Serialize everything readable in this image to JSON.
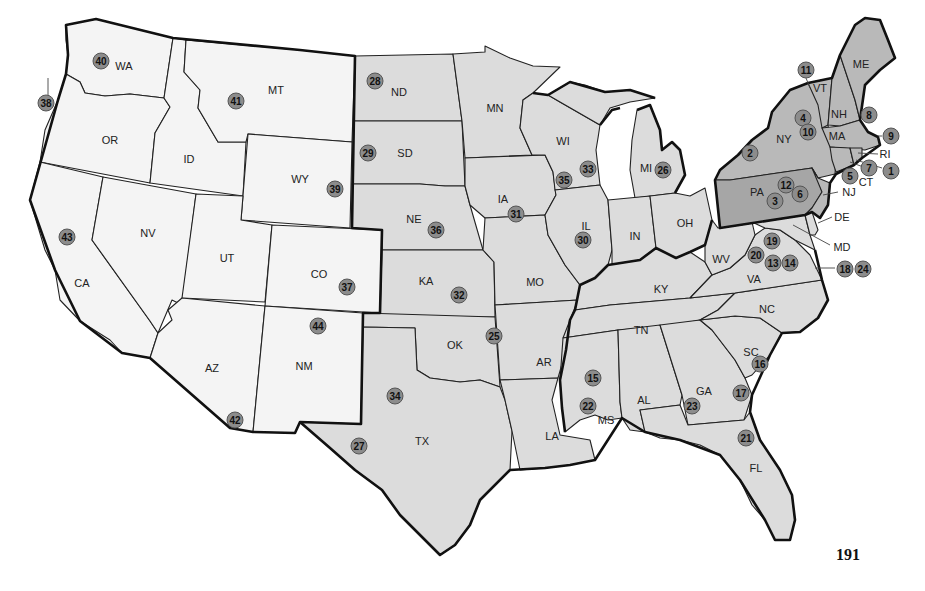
{
  "page_number": "191",
  "colors": {
    "west": "#f4f4f4",
    "central": "#dcdcdc",
    "northeast": "#b9b9b9",
    "pennsylvania": "#a6a6a6",
    "marker": "#8c8c8c",
    "border": "#222222"
  },
  "regions": {
    "west": [
      "WA",
      "OR",
      "CA",
      "ID",
      "NV",
      "MT",
      "WY",
      "UT",
      "CO",
      "AZ",
      "NM"
    ],
    "central_south": [
      "ND",
      "SD",
      "NE",
      "KA",
      "OK",
      "TX",
      "MN",
      "IA",
      "MO",
      "AR",
      "LA",
      "WI",
      "IL",
      "MI",
      "IN",
      "OH",
      "KY",
      "TN",
      "MS",
      "AL",
      "GA",
      "FL",
      "SC",
      "NC",
      "VA",
      "WV",
      "MD",
      "DE"
    ],
    "northeast": [
      "NY",
      "PA",
      "NJ",
      "CT",
      "RI",
      "MA",
      "VT",
      "NH",
      "ME"
    ]
  },
  "states": [
    {
      "abbr": "WA",
      "x": 374,
      "y": 66
    },
    {
      "abbr": "OR",
      "x": 110,
      "y": 140
    },
    {
      "abbr": "CA",
      "x": 82,
      "y": 283
    },
    {
      "abbr": "ID",
      "x": 189,
      "y": 159
    },
    {
      "abbr": "NV",
      "x": 148,
      "y": 233
    },
    {
      "abbr": "MT",
      "x": 276,
      "y": 90
    },
    {
      "abbr": "WY",
      "x": 300,
      "y": 179
    },
    {
      "abbr": "UT",
      "x": 227,
      "y": 258
    },
    {
      "abbr": "CO",
      "x": 319,
      "y": 274
    },
    {
      "abbr": "AZ",
      "x": 212,
      "y": 368
    },
    {
      "abbr": "NM",
      "x": 304,
      "y": 366
    },
    {
      "abbr": "ND",
      "x": 399,
      "y": 92
    },
    {
      "abbr": "SD",
      "x": 405,
      "y": 153
    },
    {
      "abbr": "NE",
      "x": 414,
      "y": 219
    },
    {
      "abbr": "KA",
      "x": 426,
      "y": 281
    },
    {
      "abbr": "OK",
      "x": 455,
      "y": 345
    },
    {
      "abbr": "TX",
      "x": 422,
      "y": 441
    },
    {
      "abbr": "MN",
      "x": 495,
      "y": 108
    },
    {
      "abbr": "IA",
      "x": 503,
      "y": 199
    },
    {
      "abbr": "MO",
      "x": 535,
      "y": 282
    },
    {
      "abbr": "AR",
      "x": 544,
      "y": 362
    },
    {
      "abbr": "LA",
      "x": 552,
      "y": 436
    },
    {
      "abbr": "WI",
      "x": 563,
      "y": 141
    },
    {
      "abbr": "IL",
      "x": 586,
      "y": 226
    },
    {
      "abbr": "MI",
      "x": 646,
      "y": 168
    },
    {
      "abbr": "IN",
      "x": 635,
      "y": 236
    },
    {
      "abbr": "OH",
      "x": 685,
      "y": 223
    },
    {
      "abbr": "KY",
      "x": 661,
      "y": 289
    },
    {
      "abbr": "TN",
      "x": 641,
      "y": 330
    },
    {
      "abbr": "MS",
      "x": 606,
      "y": 420
    },
    {
      "abbr": "AL",
      "x": 644,
      "y": 400
    },
    {
      "abbr": "GA",
      "x": 704,
      "y": 391
    },
    {
      "abbr": "FL",
      "x": 756,
      "y": 468
    },
    {
      "abbr": "SC",
      "x": 751,
      "y": 352
    },
    {
      "abbr": "NC",
      "x": 767,
      "y": 309
    },
    {
      "abbr": "VA",
      "x": 754,
      "y": 279
    },
    {
      "abbr": "WV",
      "x": 721,
      "y": 259
    },
    {
      "abbr": "NY",
      "x": 784,
      "y": 139
    },
    {
      "abbr": "PA",
      "x": 757,
      "y": 192
    },
    {
      "abbr": "VT",
      "x": 820,
      "y": 88
    },
    {
      "abbr": "NH",
      "x": 839,
      "y": 114
    },
    {
      "abbr": "ME",
      "x": 861,
      "y": 64
    },
    {
      "abbr": "MA",
      "x": 837,
      "y": 136
    }
  ],
  "callout_labels": [
    {
      "abbr": "RI",
      "x": 885,
      "y": 154
    },
    {
      "abbr": "CT",
      "x": 866,
      "y": 182
    },
    {
      "abbr": "NJ",
      "x": 849,
      "y": 192
    },
    {
      "abbr": "DE",
      "x": 842,
      "y": 217
    },
    {
      "abbr": "MD",
      "x": 842,
      "y": 247
    }
  ],
  "markers": [
    {
      "num": "1",
      "x": 891,
      "y": 171
    },
    {
      "num": "2",
      "x": 750,
      "y": 153
    },
    {
      "num": "3",
      "x": 775,
      "y": 201
    },
    {
      "num": "4",
      "x": 803,
      "y": 118
    },
    {
      "num": "5",
      "x": 850,
      "y": 176
    },
    {
      "num": "6",
      "x": 800,
      "y": 194
    },
    {
      "num": "7",
      "x": 869,
      "y": 168
    },
    {
      "num": "8",
      "x": 869,
      "y": 115
    },
    {
      "num": "9",
      "x": 891,
      "y": 136
    },
    {
      "num": "10",
      "x": 808,
      "y": 132
    },
    {
      "num": "11",
      "x": 806,
      "y": 70
    },
    {
      "num": "12",
      "x": 786,
      "y": 185
    },
    {
      "num": "13",
      "x": 773,
      "y": 263
    },
    {
      "num": "14",
      "x": 790,
      "y": 263
    },
    {
      "num": "15",
      "x": 593,
      "y": 378
    },
    {
      "num": "16",
      "x": 760,
      "y": 364
    },
    {
      "num": "17",
      "x": 741,
      "y": 393
    },
    {
      "num": "18",
      "x": 845,
      "y": 269
    },
    {
      "num": "19",
      "x": 772,
      "y": 241
    },
    {
      "num": "20",
      "x": 756,
      "y": 255
    },
    {
      "num": "21",
      "x": 746,
      "y": 438
    },
    {
      "num": "22",
      "x": 588,
      "y": 406
    },
    {
      "num": "23",
      "x": 692,
      "y": 406
    },
    {
      "num": "24",
      "x": 863,
      "y": 269
    },
    {
      "num": "25",
      "x": 494,
      "y": 336
    },
    {
      "num": "26",
      "x": 663,
      "y": 170
    },
    {
      "num": "27",
      "x": 359,
      "y": 446
    },
    {
      "num": "28",
      "x": 375,
      "y": 81
    },
    {
      "num": "29",
      "x": 368,
      "y": 153
    },
    {
      "num": "30",
      "x": 583,
      "y": 240
    },
    {
      "num": "31",
      "x": 516,
      "y": 214
    },
    {
      "num": "32",
      "x": 459,
      "y": 295
    },
    {
      "num": "33",
      "x": 588,
      "y": 169
    },
    {
      "num": "34",
      "x": 395,
      "y": 396
    },
    {
      "num": "35",
      "x": 564,
      "y": 180
    },
    {
      "num": "36",
      "x": 436,
      "y": 230
    },
    {
      "num": "37",
      "x": 347,
      "y": 287
    },
    {
      "num": "38",
      "x": 46,
      "y": 103
    },
    {
      "num": "39",
      "x": 335,
      "y": 189
    },
    {
      "num": "40",
      "x": 101,
      "y": 61
    },
    {
      "num": "41",
      "x": 236,
      "y": 101
    },
    {
      "num": "42",
      "x": 235,
      "y": 420
    },
    {
      "num": "43",
      "x": 67,
      "y": 237
    },
    {
      "num": "44",
      "x": 318,
      "y": 326
    }
  ]
}
